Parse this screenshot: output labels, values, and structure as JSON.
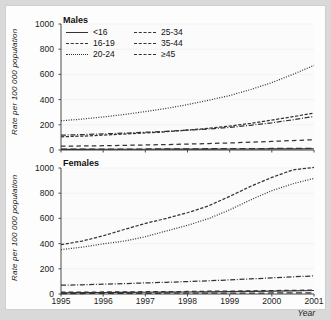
{
  "figure": {
    "background": "#fdfdfd",
    "axis_color": "#4a4a4a",
    "line_color": "#333333",
    "x_axis_label": "Year",
    "y_axis_label": "Rate per 100 000 population"
  },
  "panels": {
    "males": {
      "title": "Males"
    },
    "females": {
      "title": "Females"
    }
  },
  "legend": {
    "items": [
      {
        "label": "<16",
        "style": "solid"
      },
      {
        "label": "25-34",
        "style": "dashdot"
      },
      {
        "label": "16-19",
        "style": "dashed"
      },
      {
        "label": "35-44",
        "style": "longdash"
      },
      {
        "label": "20-24",
        "style": "dotted"
      },
      {
        "label": "≥45",
        "style": "widedash"
      }
    ]
  },
  "chart_data": [
    {
      "type": "line",
      "title": "Males",
      "xlabel": "Year",
      "ylabel": "Rate per 100 000 population",
      "xlim": [
        1995,
        2001
      ],
      "ylim": [
        0,
        1000
      ],
      "xticks": [
        1995,
        1996,
        1997,
        1998,
        1999,
        2000,
        2001
      ],
      "yticks": [
        0,
        200,
        400,
        600,
        800,
        1000
      ],
      "grid": false,
      "legend_position": "top-left",
      "x": [
        1995,
        1995.5,
        1996,
        1996.5,
        1997,
        1997.5,
        1998,
        1998.5,
        1999,
        1999.5,
        2000,
        2000.5,
        2001
      ],
      "series": [
        {
          "name": "<16",
          "style": "solid",
          "values": [
            5,
            5,
            6,
            6,
            6,
            7,
            7,
            7,
            8,
            8,
            9,
            9,
            10
          ]
        },
        {
          "name": "16-19",
          "style": "dashed",
          "values": [
            105,
            110,
            118,
            126,
            135,
            145,
            158,
            172,
            190,
            212,
            238,
            265,
            292
          ]
        },
        {
          "name": "20-24",
          "style": "dotted",
          "values": [
            232,
            245,
            262,
            282,
            305,
            330,
            360,
            395,
            432,
            480,
            535,
            600,
            672
          ]
        },
        {
          "name": "25-34",
          "style": "dashdot",
          "values": [
            118,
            122,
            128,
            134,
            141,
            148,
            157,
            167,
            180,
            196,
            216,
            240,
            266
          ]
        },
        {
          "name": "35-44",
          "style": "longdash",
          "values": [
            30,
            32,
            34,
            37,
            40,
            43,
            47,
            51,
            56,
            62,
            68,
            75,
            82
          ]
        },
        {
          "name": "≥45",
          "style": "widedash",
          "values": [
            6,
            6,
            7,
            7,
            8,
            8,
            9,
            10,
            10,
            11,
            12,
            13,
            14
          ]
        }
      ]
    },
    {
      "type": "line",
      "title": "Females",
      "xlabel": "Year",
      "ylabel": "Rate per 100 000 population",
      "xlim": [
        1995,
        2001
      ],
      "ylim": [
        0,
        1000
      ],
      "xticks": [
        1995,
        1996,
        1997,
        1998,
        1999,
        2000,
        2001
      ],
      "yticks": [
        0,
        200,
        400,
        600,
        800,
        1000
      ],
      "grid": false,
      "legend_position": "none",
      "x": [
        1995,
        1995.5,
        1996,
        1996.5,
        1997,
        1997.5,
        1998,
        1998.5,
        1999,
        1999.5,
        2000,
        2000.5,
        2001
      ],
      "series": [
        {
          "name": "<16",
          "style": "solid",
          "values": [
            10,
            11,
            12,
            13,
            14,
            15,
            16,
            17,
            19,
            21,
            23,
            25,
            28
          ]
        },
        {
          "name": "16-19",
          "style": "dashed",
          "values": [
            392,
            420,
            462,
            512,
            560,
            600,
            645,
            700,
            775,
            855,
            925,
            985,
            1005
          ]
        },
        {
          "name": "20-24",
          "style": "dotted",
          "values": [
            352,
            372,
            398,
            420,
            455,
            500,
            545,
            598,
            668,
            748,
            820,
            875,
            918
          ]
        },
        {
          "name": "25-34",
          "style": "dashdot",
          "values": [
            70,
            73,
            78,
            82,
            88,
            93,
            99,
            105,
            112,
            120,
            128,
            136,
            144
          ]
        },
        {
          "name": "35-44",
          "style": "longdash",
          "values": [
            14,
            15,
            16,
            17,
            18,
            19,
            20,
            22,
            23,
            25,
            27,
            29,
            31
          ]
        },
        {
          "name": "≥45",
          "style": "widedash",
          "values": [
            4,
            4,
            5,
            5,
            5,
            6,
            6,
            6,
            7,
            7,
            8,
            8,
            9
          ]
        }
      ]
    }
  ]
}
